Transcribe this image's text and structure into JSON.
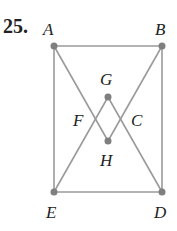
{
  "problem_number": "25.",
  "colors": {
    "line": "#9a9a9a",
    "point": "#7f7f7f",
    "text": "#222222"
  },
  "points": [
    {
      "id": "A",
      "x": 54,
      "y": 46,
      "lx": 43,
      "ly": 35
    },
    {
      "id": "B",
      "x": 162,
      "y": 46,
      "lx": 155,
      "ly": 35
    },
    {
      "id": "E",
      "x": 54,
      "y": 192,
      "lx": 46,
      "ly": 218
    },
    {
      "id": "D",
      "x": 162,
      "y": 192,
      "lx": 154,
      "ly": 218
    },
    {
      "id": "G",
      "x": 108,
      "y": 97,
      "lx": 100,
      "ly": 85
    },
    {
      "id": "H",
      "x": 108,
      "y": 141,
      "lx": 100,
      "ly": 166
    }
  ],
  "labels_only": [
    {
      "id": "F",
      "lx": 73,
      "ly": 126
    },
    {
      "id": "C",
      "lx": 131,
      "ly": 126
    }
  ],
  "edges": [
    [
      "A",
      "B"
    ],
    [
      "B",
      "D"
    ],
    [
      "D",
      "E"
    ],
    [
      "E",
      "A"
    ],
    [
      "A",
      "H"
    ],
    [
      "H",
      "B"
    ],
    [
      "E",
      "G"
    ],
    [
      "G",
      "D"
    ]
  ]
}
